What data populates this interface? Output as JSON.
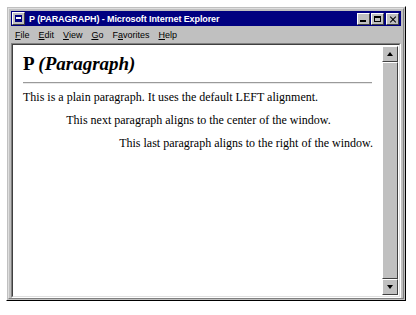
{
  "window": {
    "title": "P (PARAGRAPH) - Microsoft Internet Explorer",
    "app_icon": "ie-document-icon",
    "titlebar_color": "#000080",
    "chrome_color": "#c0c0c0",
    "buttons": {
      "minimize_label": "",
      "maximize_label": "",
      "close_label": ""
    }
  },
  "menubar": {
    "items": [
      {
        "label": "File",
        "accel": "F"
      },
      {
        "label": "Edit",
        "accel": "E"
      },
      {
        "label": "View",
        "accel": "V"
      },
      {
        "label": "Go",
        "accel": "G"
      },
      {
        "label": "Favorites",
        "accel": "a"
      },
      {
        "label": "Help",
        "accel": "H"
      }
    ]
  },
  "document": {
    "heading_plain": "P ",
    "heading_italic": "(Paragraph)",
    "paragraphs": [
      {
        "text": "This is a plain paragraph. It uses the default LEFT alignment.",
        "align": "left"
      },
      {
        "text": "This next paragraph aligns to the center of the window.",
        "align": "center"
      },
      {
        "text": "This last paragraph aligns to the right of the window.",
        "align": "right"
      }
    ],
    "text_color": "#000000",
    "background_color": "#ffffff"
  },
  "scrollbar": {
    "up_icon": "triangle-up-icon",
    "down_icon": "triangle-down-icon",
    "position": "top"
  }
}
